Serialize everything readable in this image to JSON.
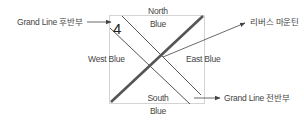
{
  "diagram": {
    "number": "4",
    "regions": {
      "north": {
        "line1": "North",
        "line2": "Blue"
      },
      "south": {
        "line1": "South",
        "line2": "Blue"
      },
      "west": "West Blue",
      "east": "East Blue"
    },
    "callouts": {
      "grand_line_second_half": "Grand Line 후반부",
      "reverse_mountain": "리버스 마운틴",
      "grand_line_first_half": "Grand Line 전반부"
    },
    "colors": {
      "box_border": "#d4d4d4",
      "thick_line": "#555555",
      "thin_line": "#555555",
      "arrow": "#444444",
      "text": "#444444"
    }
  }
}
